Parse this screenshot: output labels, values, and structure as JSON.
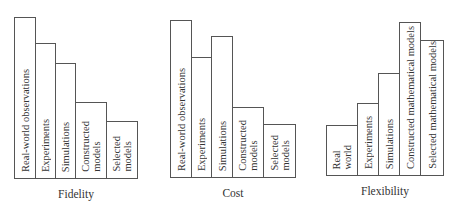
{
  "chart_data": [
    {
      "type": "bar",
      "title": "Fidelity",
      "categories": [
        "Real-world observations",
        "Experiments",
        "Simulations",
        "Constructed\nmodels",
        "Selected\nmodels"
      ],
      "values": [
        162,
        136,
        116,
        77,
        58
      ],
      "xlabel": "Fidelity",
      "ylabel": "",
      "grid": false,
      "legend": "none",
      "note": "qualitative relative heights (px)"
    },
    {
      "type": "bar",
      "title": "Cost",
      "categories": [
        "Real-world observations",
        "Experiments",
        "Simulations",
        "Constructed\nmodels",
        "Selected\nmodels"
      ],
      "values": [
        158,
        121,
        142,
        71,
        54
      ],
      "xlabel": "Cost",
      "ylabel": "",
      "grid": false,
      "legend": "none",
      "note": "qualitative relative heights (px)"
    },
    {
      "type": "bar",
      "title": "Flexibility",
      "categories": [
        "Real\nworld",
        "Experiments",
        "Simulations",
        "Constructed mathematical models",
        "Selected mathematical models"
      ],
      "values": [
        51,
        73,
        103,
        154,
        136
      ],
      "xlabel": "Flexibility",
      "ylabel": "",
      "grid": false,
      "legend": "none",
      "note": "qualitative relative heights (px)"
    }
  ],
  "layout": [
    {
      "left": 14,
      "baseline": 179,
      "title_top": 185,
      "widths": [
        22,
        20,
        20,
        31,
        31
      ]
    },
    {
      "left": 170,
      "baseline": 178,
      "title_top": 184,
      "widths": [
        22,
        20,
        21,
        31,
        32
      ]
    },
    {
      "left": 326,
      "baseline": 176,
      "title_top": 182,
      "widths": [
        32,
        21,
        21,
        21,
        23
      ]
    }
  ]
}
